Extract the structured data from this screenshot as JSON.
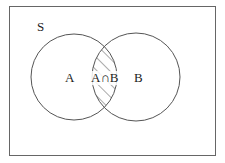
{
  "diagram": {
    "type": "venn",
    "universe_label": "S",
    "sets": [
      {
        "name": "A",
        "label": "A"
      },
      {
        "name": "B",
        "label": "B"
      }
    ],
    "intersection_label": "A∩B",
    "shaded_region": "A∩B",
    "colors": {
      "stroke": "#555555",
      "background": "#ffffff",
      "text": "#222222"
    }
  }
}
